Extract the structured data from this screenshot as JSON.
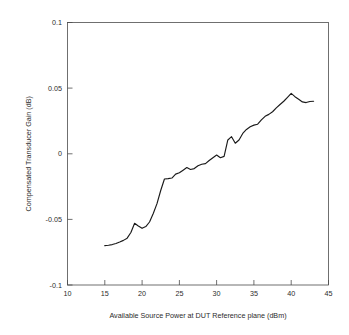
{
  "chart_data": {
    "type": "line",
    "title": "",
    "xlabel": "Available Source Power at DUT Reference plane (dBm)",
    "ylabel": "Compensated Transducer Gain (dB)",
    "xlim": [
      10,
      45
    ],
    "ylim": [
      -0.1,
      0.1
    ],
    "xticks": [
      10,
      15,
      20,
      25,
      30,
      35,
      40,
      45
    ],
    "yticks": [
      -0.1,
      -0.05,
      0,
      0.05,
      0.1
    ],
    "xtick_labels": [
      "10",
      "15",
      "20",
      "25",
      "30",
      "35",
      "40",
      "45"
    ],
    "ytick_labels": [
      "-0.1",
      "-0.05",
      "0",
      "0.05",
      "0.1"
    ],
    "grid": false,
    "legend": false,
    "legend_position": "none",
    "line_color": "#1a1a1a",
    "series": [
      {
        "name": "Compensated Transducer Gain",
        "x": [
          15.0,
          15.5,
          16.0,
          16.5,
          17.0,
          17.5,
          18.0,
          18.5,
          19.0,
          19.5,
          20.0,
          20.5,
          21.0,
          21.5,
          22.0,
          22.5,
          23.0,
          23.5,
          24.0,
          24.5,
          25.0,
          25.5,
          26.0,
          26.5,
          27.0,
          27.5,
          28.0,
          28.5,
          29.0,
          29.5,
          30.0,
          30.5,
          31.0,
          31.5,
          32.0,
          32.5,
          33.0,
          33.5,
          34.0,
          34.5,
          35.0,
          35.5,
          36.0,
          36.5,
          37.0,
          37.5,
          38.0,
          38.5,
          39.0,
          39.5,
          40.0,
          40.5,
          41.0,
          41.5,
          42.0,
          42.5,
          43.0
        ],
        "y": [
          -0.07,
          -0.0697,
          -0.0692,
          -0.0684,
          -0.0673,
          -0.066,
          -0.0643,
          -0.06,
          -0.053,
          -0.055,
          -0.0568,
          -0.0555,
          -0.052,
          -0.0455,
          -0.038,
          -0.028,
          -0.0192,
          -0.019,
          -0.0185,
          -0.0155,
          -0.0145,
          -0.0125,
          -0.0105,
          -0.012,
          -0.0113,
          -0.0092,
          -0.008,
          -0.0075,
          -0.0052,
          -0.003,
          -0.001,
          -0.003,
          -0.002,
          0.0105,
          0.013,
          0.008,
          0.0105,
          0.0155,
          0.0185,
          0.0205,
          0.0218,
          0.0225,
          0.0258,
          0.0285,
          0.03,
          0.032,
          0.035,
          0.0375,
          0.04,
          0.043,
          0.046,
          0.0435,
          0.0415,
          0.0395,
          0.039,
          0.0398,
          0.04
        ]
      }
    ],
    "annotations": []
  },
  "figure": {
    "background_color": "#ffffff",
    "axis_color": "#4d4d4d"
  }
}
